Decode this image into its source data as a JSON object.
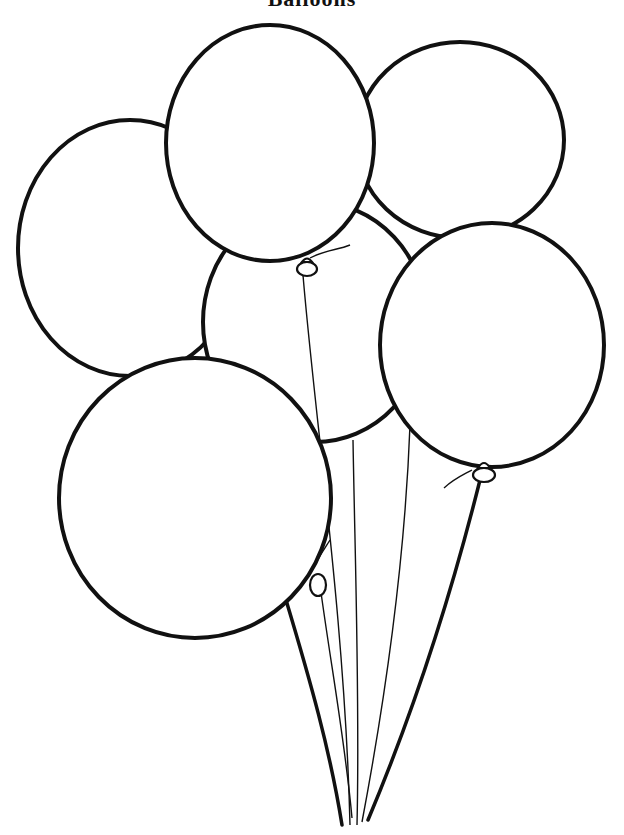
{
  "page": {
    "title": "Balloons",
    "background": "#ffffff",
    "line_color": "#111111"
  },
  "artwork": {
    "subject": "bunch of balloons coloring page",
    "balloon_count": 6,
    "balloons": [
      {
        "name": "left-back",
        "cx": 130,
        "cy": 248
      },
      {
        "name": "top-center",
        "cx": 270,
        "cy": 143
      },
      {
        "name": "top-right",
        "cx": 460,
        "cy": 140
      },
      {
        "name": "middle",
        "cx": 315,
        "cy": 322
      },
      {
        "name": "right",
        "cx": 492,
        "cy": 345
      },
      {
        "name": "bottom-left",
        "cx": 195,
        "cy": 498
      }
    ]
  }
}
